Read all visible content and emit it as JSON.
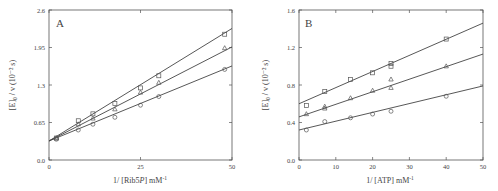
{
  "chart_data": [
    {
      "type": "scatter",
      "panel_label": "A",
      "title": "",
      "xlabel": "1/ [Rib5P] mM⁻¹",
      "xlabel_parts": {
        "prefix": "1/ [Rib5",
        "italic": "P",
        "suffix": "] mM",
        "sup": "-1"
      },
      "ylabel": "[E]₀ / v (10⁻² s)",
      "xlim": [
        0,
        50
      ],
      "ylim": [
        0,
        2.6
      ],
      "xticks": [
        0,
        25,
        50
      ],
      "xtick_labels": [
        "0",
        "25",
        "50"
      ],
      "yticks": [
        0.0,
        0.65,
        1.3,
        1.95,
        2.6
      ],
      "ytick_labels": [
        "0.0",
        "0.65",
        "1.3",
        "1.95",
        "2.6"
      ],
      "grid": false,
      "series": [
        {
          "name": "squares",
          "marker": "square",
          "x": [
            2,
            8,
            12,
            18,
            25,
            30,
            48
          ],
          "y": [
            0.38,
            0.68,
            0.8,
            0.98,
            1.25,
            1.46,
            2.18
          ],
          "fit": {
            "intercept": 0.33,
            "end_y": 2.28
          }
        },
        {
          "name": "triangles",
          "marker": "triangle",
          "x": [
            2,
            8,
            12,
            18,
            25,
            30,
            48
          ],
          "y": [
            0.38,
            0.62,
            0.72,
            0.88,
            1.17,
            1.34,
            1.94
          ],
          "fit": {
            "intercept": 0.33,
            "end_y": 1.96
          }
        },
        {
          "name": "circles",
          "marker": "circle",
          "x": [
            2,
            8,
            12,
            18,
            25,
            30,
            48
          ],
          "y": [
            0.36,
            0.52,
            0.62,
            0.74,
            0.95,
            1.1,
            1.57
          ],
          "fit": {
            "intercept": 0.33,
            "end_y": 1.63
          }
        }
      ]
    },
    {
      "type": "scatter",
      "panel_label": "B",
      "title": "",
      "xlabel": "1/ [ATP] mM⁻¹",
      "xlabel_parts": {
        "prefix": "1/ [ATP] mM",
        "sup": "-1"
      },
      "ylabel": "[E]₀ / v (10⁻² s)",
      "xlim": [
        0,
        50
      ],
      "ylim": [
        0,
        1.6
      ],
      "xticks": [
        0,
        10,
        20,
        30,
        40,
        50
      ],
      "xtick_labels": [
        "0",
        "10",
        "20",
        "30",
        "40",
        "50"
      ],
      "yticks": [
        0.0,
        0.4,
        0.8,
        1.2,
        1.6
      ],
      "ytick_labels": [
        "0.0",
        "0.4",
        "0.8",
        "1.2",
        "1.6"
      ],
      "grid": false,
      "series": [
        {
          "name": "squares",
          "marker": "square",
          "x": [
            2,
            7,
            14,
            20,
            25,
            25,
            40
          ],
          "y": [
            0.58,
            0.73,
            0.86,
            0.93,
            1.03,
            1.0,
            1.29
          ],
          "fit": {
            "intercept": 0.6,
            "end_y": 1.46
          }
        },
        {
          "name": "triangles",
          "marker": "triangle",
          "x": [
            2,
            7,
            7,
            14,
            20,
            25,
            25,
            40
          ],
          "y": [
            0.49,
            0.57,
            0.55,
            0.66,
            0.74,
            0.86,
            0.77,
            1.0
          ],
          "fit": {
            "intercept": 0.46,
            "end_y": 1.13
          }
        },
        {
          "name": "circles",
          "marker": "circle",
          "x": [
            2,
            7,
            14,
            20,
            25,
            40
          ],
          "y": [
            0.32,
            0.41,
            0.45,
            0.49,
            0.52,
            0.68
          ],
          "fit": {
            "intercept": 0.32,
            "end_y": 0.79
          }
        }
      ]
    }
  ],
  "panels": {
    "a": {
      "label": "A",
      "ylabel": "[E]₀ / v (10⁻² s)",
      "xlabel_prefix": "1/ [Rib5",
      "xlabel_italic": "P",
      "xlabel_suffix": "] mM",
      "xlabel_sup": "-1"
    },
    "b": {
      "label": "B",
      "ylabel": "[E]₀ / v (10⁻² s)",
      "xlabel_prefix": "1/ [ATP] mM",
      "xlabel_sup": "-1"
    }
  },
  "colors": {
    "axis": "#555555",
    "line": "#444444",
    "marker": "#555555",
    "text": "#444444"
  }
}
